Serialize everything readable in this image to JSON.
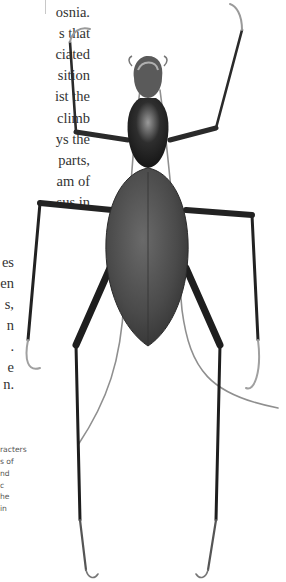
{
  "body_text": {
    "lines": [
      {
        "text": "osnia.",
        "y": 14
      },
      {
        "text": "s that",
        "y": 35
      },
      {
        "text": "ciated",
        "y": 56
      },
      {
        "text": "sition",
        "y": 77
      },
      {
        "text": "ist the",
        "y": 98
      },
      {
        "text": "climb",
        "y": 120
      },
      {
        "text": "ys the",
        "y": 141
      },
      {
        "text": "parts,",
        "y": 162
      },
      {
        "text": "am of",
        "y": 183
      },
      {
        "text": "sus in",
        "y": 204
      }
    ]
  },
  "body_text_lower": {
    "lines": [
      {
        "text": "es",
        "y": 264
      },
      {
        "text": "en",
        "y": 285
      },
      {
        "text": "s,",
        "y": 306
      },
      {
        "text": "n",
        "y": 327
      },
      {
        "text": ".",
        "y": 348
      },
      {
        "text": "e",
        "y": 369
      },
      {
        "text": "n.",
        "y": 386
      }
    ]
  },
  "caption": {
    "lines": [
      {
        "text": "racters",
        "y": 450
      },
      {
        "text": "s of",
        "y": 462
      },
      {
        "text": "nd",
        "y": 474
      },
      {
        "text": "c",
        "y": 486
      },
      {
        "text": "he",
        "y": 497
      },
      {
        "text": "in",
        "y": 509
      }
    ]
  },
  "figure": {
    "colors": {
      "body_dark": "#2a2a2a",
      "elytra": "#4a4a4a",
      "leg": "#333333",
      "antenna": "#9a9a9a",
      "highlight": "#8c8c8c"
    }
  }
}
